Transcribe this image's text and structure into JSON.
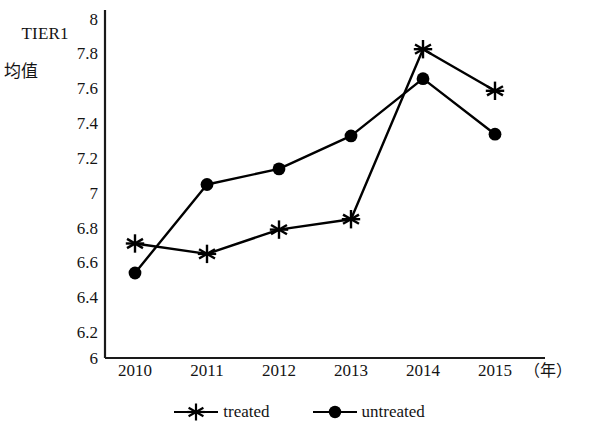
{
  "chart_data": {
    "type": "line",
    "title": "",
    "ylabel": "TIER1\n均值",
    "ylabel_line1": "TIER1",
    "ylabel_line2": "均值",
    "xlabel": "（年）",
    "categories": [
      "2010",
      "2011",
      "2012",
      "2013",
      "2014",
      "2015"
    ],
    "x": [
      2010,
      2011,
      2012,
      2013,
      2014,
      2015
    ],
    "series": [
      {
        "name": "treated",
        "marker": "asterisk",
        "color": "#000000",
        "values": [
          6.66,
          6.6,
          6.74,
          6.8,
          7.78,
          7.54
        ]
      },
      {
        "name": "untreated",
        "marker": "filled-circle",
        "color": "#000000",
        "values": [
          6.49,
          7.0,
          7.09,
          7.28,
          7.61,
          7.29
        ]
      }
    ],
    "ylim": [
      6,
      8
    ],
    "ytick_step": 0.2,
    "yticks": [
      "8",
      "7.8",
      "7.6",
      "7.4",
      "7.2",
      "7",
      "6.8",
      "6.6",
      "6.4",
      "6.2",
      "6"
    ],
    "grid": false,
    "legend_position": "bottom-center"
  },
  "legend": {
    "entries": [
      {
        "label": "treated",
        "marker": "asterisk"
      },
      {
        "label": "untreated",
        "marker": "filled-circle"
      }
    ]
  },
  "axes": {
    "x_unit_label": "（年）"
  }
}
